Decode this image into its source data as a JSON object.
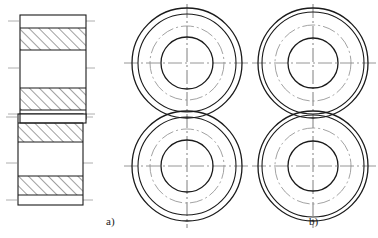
{
  "figure": {
    "title": "",
    "caption_a": "a)",
    "caption_b": "b)",
    "line_color": "#1a1a1a",
    "centerline_color": "#8a8a8a",
    "hatch_color": "#2b2b2b",
    "background": "#ffffff"
  },
  "views": {
    "section_view": {
      "name": "longitudinal-section",
      "upper_block": {
        "x": 20,
        "y": 15,
        "width": 66,
        "height": 104,
        "hatch_bands": [
          {
            "y": 28,
            "height": 22
          },
          {
            "y": 88,
            "height": 22
          }
        ],
        "centerlines_y": [
          21,
          68,
          114
        ]
      },
      "lower_block": {
        "x": 18,
        "y": 114,
        "width": 65,
        "height": 91,
        "hatch_bands": [
          {
            "y": 121,
            "height": 19
          },
          {
            "y": 176,
            "height": 19
          }
        ],
        "centerlines_y": [
          117,
          163,
          200
        ]
      }
    },
    "view_a": {
      "name": "front-view-a",
      "upper_circle": {
        "cx": 187,
        "cy": 63,
        "r_outer": 55,
        "r_mid": 49,
        "r_bore": 26
      },
      "lower_circle": {
        "cx": 187,
        "cy": 166,
        "r_outer": 55,
        "r_mid": 49,
        "r_bore": 26
      },
      "centerline_vertical_x": 187,
      "centerline_horizontal_y": [
        63,
        166
      ]
    },
    "view_b": {
      "name": "front-view-b",
      "upper_circle": {
        "cx": 313,
        "cy": 63,
        "r_outer": 55,
        "r_mid": 51,
        "r_bore": 25
      },
      "lower_circle": {
        "cx": 313,
        "cy": 166,
        "r_outer": 55,
        "r_mid": 51,
        "r_bore": 25
      },
      "centerline_vertical_x": 313,
      "centerline_horizontal_y": [
        63,
        166
      ]
    }
  }
}
